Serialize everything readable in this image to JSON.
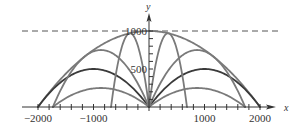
{
  "chart_data": {
    "type": "line",
    "title": "",
    "xlabel": "x",
    "ylabel": "y",
    "xlim": [
      -2500,
      2800
    ],
    "ylim": [
      0,
      1050
    ],
    "x_tick_labels": [
      "-2000",
      "-1000",
      "1000",
      "2000"
    ],
    "x_tick_values": [
      -2000,
      -1000,
      1000,
      2000
    ],
    "y_tick_labels": [
      "500",
      "1000"
    ],
    "y_tick_values": [
      500,
      1000
    ],
    "minor_tick_step_x": 200,
    "minor_tick_step_y": 100,
    "grid": false,
    "legend": null,
    "reference_lines": [
      {
        "name": "max-height",
        "type": "horizontal-dashed",
        "y": 1000
      }
    ],
    "series": [
      {
        "name": "envelope (safety parabola)",
        "equation": "y = 1000 - x^2/4000",
        "x_range": [
          -2000,
          2000
        ],
        "vertex": [
          0,
          1000
        ],
        "color": "#7a7a7a"
      },
      {
        "name": "45deg right",
        "range_end": 2000,
        "max_height": 500,
        "vertex": [
          1000,
          500
        ],
        "color": "#3a3a3a"
      },
      {
        "name": "45deg left",
        "range_end": -2000,
        "max_height": 500,
        "vertex": [
          -1000,
          500
        ],
        "color": "#3a3a3a"
      },
      {
        "name": "30deg right",
        "range_end": 1732,
        "max_height": 250,
        "vertex": [
          866,
          250
        ],
        "color": "#7a7a7a"
      },
      {
        "name": "30deg left",
        "range_end": -1732,
        "max_height": 250,
        "vertex": [
          -866,
          250
        ],
        "color": "#7a7a7a"
      },
      {
        "name": "60deg right",
        "range_end": 1732,
        "max_height": 750,
        "vertex": [
          866,
          750
        ],
        "color": "#7a7a7a"
      },
      {
        "name": "60deg left",
        "range_end": -1732,
        "max_height": 750,
        "vertex": [
          -866,
          750
        ],
        "color": "#7a7a7a"
      },
      {
        "name": "80deg right",
        "range_end": 684,
        "max_height": 970,
        "vertex": [
          342,
          970
        ],
        "color": "#7a7a7a"
      },
      {
        "name": "80deg left",
        "range_end": -684,
        "max_height": 970,
        "vertex": [
          -342,
          970
        ],
        "color": "#7a7a7a"
      }
    ],
    "style": {
      "axis_color": "#333333",
      "curve_gray": "#7a7a7a",
      "curve_dark": "#3a3a3a",
      "dash_color": "#555555"
    }
  }
}
